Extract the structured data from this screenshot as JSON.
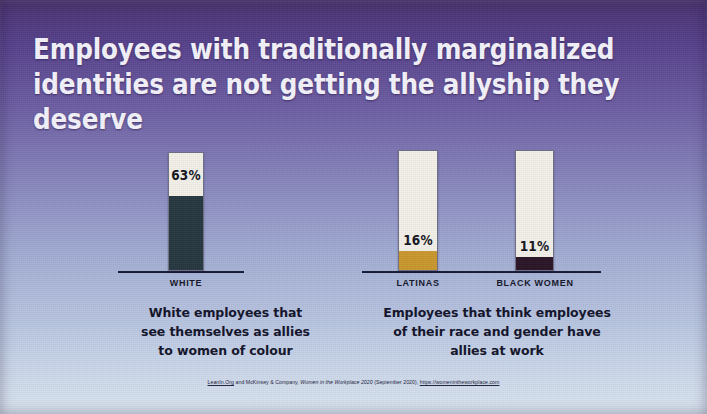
{
  "title": "Employees with traditionally marginalized\nidentities are not getting  the allyship they deserve",
  "colors": {
    "bar_empty": "#f3f0e8",
    "white_group_fill": "#26373f",
    "latinas_fill": "#c9972e",
    "black_women_fill": "#2a1426",
    "axis": "#151a35",
    "title_text": "#f4f2fa",
    "body_text": "#12132a",
    "bg_top": "#4a3270",
    "bg_bottom": "#dbe5f1"
  },
  "panels": [
    {
      "id": "left",
      "caption": "White employees that\nsee themselves as allies\nto women of colour",
      "bars": [
        {
          "category": "WHITE",
          "value": 63,
          "label": "63%",
          "fill": "#26373f"
        }
      ]
    },
    {
      "id": "right",
      "caption": "Employees that think employees\nof their race and gender have\nallies at work",
      "bars": [
        {
          "category": "LATINAS",
          "value": 16,
          "label": "16%",
          "fill": "#c9972e"
        },
        {
          "category": "BLACK WOMEN",
          "value": 11,
          "label": "11%",
          "fill": "#2a1426"
        }
      ]
    }
  ],
  "source": {
    "prefix": "LeanIn.Org",
    "mid": " and McKinsey & Company, ",
    "italic": "Women in the Workplace 2020",
    "post": " (September 2020), ",
    "url": "https://womenintheworkplace.com"
  },
  "chart_data": {
    "type": "bar",
    "title": "Employees with traditionally marginalized identities are not getting the allyship they deserve",
    "categories": [
      "WHITE",
      "LATINAS",
      "BLACK WOMEN"
    ],
    "values": [
      63,
      16,
      11
    ],
    "value_labels": [
      "63%",
      "16%",
      "11%"
    ],
    "unit": "percent",
    "ylim": [
      0,
      100
    ],
    "xlabel": "",
    "ylabel": "",
    "grid": false,
    "legend": "none",
    "groups": [
      {
        "name": "White employees that see themselves as allies to women of colour",
        "categories": [
          "WHITE"
        ],
        "values": [
          63
        ]
      },
      {
        "name": "Employees that think employees of their race and gender have allies at work",
        "categories": [
          "LATINAS",
          "BLACK WOMEN"
        ],
        "values": [
          16,
          11
        ]
      }
    ],
    "series_colors": [
      "#26373f",
      "#c9972e",
      "#2a1426"
    ],
    "source": "LeanIn.Org and McKinsey & Company, Women in the Workplace 2020 (September 2020), https://womenintheworkplace.com"
  }
}
